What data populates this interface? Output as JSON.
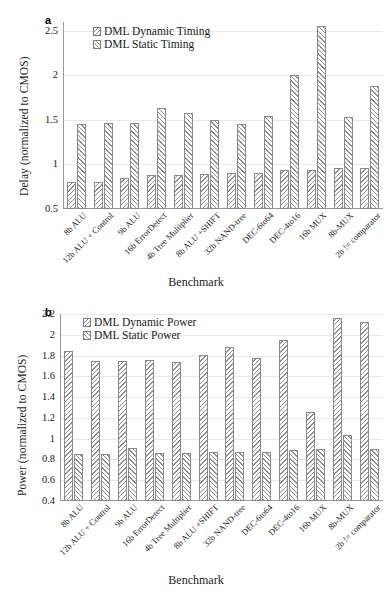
{
  "figure": {
    "panel_a_letter": "a",
    "panel_b_letter": "b"
  },
  "chart_data": [
    {
      "type": "bar",
      "panel": "a",
      "title": "",
      "xlabel": "Benchmark",
      "ylabel": "Delay (normalized to CMOS)",
      "ylim": [
        0.5,
        2.6
      ],
      "yticks": [
        "0.5",
        "1",
        "1.5",
        "2",
        "2.5"
      ],
      "ytickvals": [
        0.5,
        1,
        1.5,
        2,
        2.5
      ],
      "grid": true,
      "legend_position": "top-left-inside",
      "categories": [
        "8b ALU",
        "12b ALU + Control",
        "9b ALU",
        "16b ErrorDetect",
        "4b Tree Multiplier",
        "8b ALU +SHIFT",
        "32b NAND-tree",
        "DEC-6to64",
        "DEC-4to16",
        "16b MUX",
        "8b-MUX",
        "2b != comparator"
      ],
      "series": [
        {
          "name": "DML Dynamic Timing",
          "values": [
            0.8,
            0.8,
            0.85,
            0.88,
            0.88,
            0.89,
            0.91,
            0.9,
            0.94,
            0.94,
            0.96,
            0.96
          ]
        },
        {
          "name": "DML Static Timing",
          "values": [
            1.45,
            1.47,
            1.47,
            1.63,
            1.58,
            1.5,
            1.45,
            1.54,
            2.01,
            2.56,
            1.53,
            1.88
          ]
        }
      ]
    },
    {
      "type": "bar",
      "panel": "b",
      "title": "",
      "xlabel": "Benchmark",
      "ylabel": "Power (normalized to CMOS)",
      "ylim": [
        0.4,
        2.2
      ],
      "yticks": [
        "0.4",
        "0.6",
        "0.8",
        "1",
        "1.2",
        "1.4",
        "1.6",
        "1.8",
        "2",
        "2.2"
      ],
      "ytickvals": [
        0.4,
        0.6,
        0.8,
        1.0,
        1.2,
        1.4,
        1.6,
        1.8,
        2.0,
        2.2
      ],
      "grid": true,
      "legend_position": "top-left-inside",
      "categories": [
        "8b ALU",
        "12b ALU + Control",
        "9b ALU",
        "16b ErrorDetect",
        "4b Tree Multiplier",
        "8b ALU +SHIFT",
        "32b NAND-tree",
        "DEC-6to64",
        "DEC-4to16",
        "16b MUX",
        "8b-MUX",
        "2b != comparator"
      ],
      "series": [
        {
          "name": "DML Dynamic Power",
          "values": [
            1.84,
            1.75,
            1.75,
            1.76,
            1.74,
            1.81,
            1.88,
            1.78,
            1.95,
            1.26,
            2.16,
            2.12
          ]
        },
        {
          "name": "DML Static Power",
          "values": [
            0.85,
            0.85,
            0.91,
            0.86,
            0.86,
            0.87,
            0.87,
            0.87,
            0.89,
            0.9,
            1.04,
            0.9
          ]
        }
      ]
    }
  ]
}
